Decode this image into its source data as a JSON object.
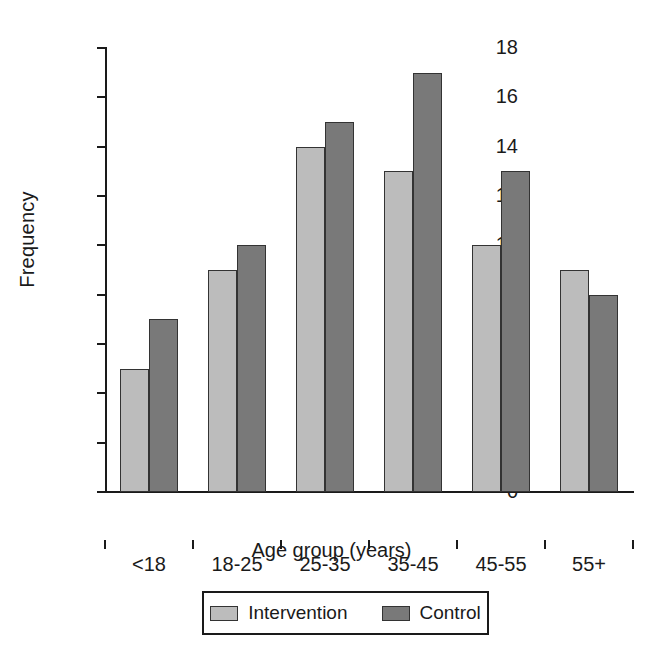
{
  "chart_data": {
    "type": "bar",
    "title": "",
    "xlabel": "Age group (years)",
    "ylabel": "Frequency",
    "categories": [
      "<18",
      "18-25",
      "25-35",
      "35-45",
      "45-55",
      "55+"
    ],
    "series": [
      {
        "name": "Intervention",
        "color": "#bcbcbc",
        "values": [
          5,
          9,
          14,
          13,
          10,
          9
        ]
      },
      {
        "name": "Control",
        "color": "#797979",
        "values": [
          7,
          10,
          15,
          17,
          13,
          8
        ]
      }
    ],
    "ylim": [
      0,
      18
    ],
    "ytick_values": [
      0,
      2,
      4,
      6,
      8,
      10,
      12,
      14,
      16,
      18
    ],
    "ytick_labels": [
      "0",
      "2",
      "4",
      "6",
      "8",
      "10",
      "12",
      "14",
      "16",
      "18"
    ],
    "grid": false,
    "legend_position": "bottom-center",
    "legend_entries": [
      "Intervention",
      "Control"
    ]
  }
}
